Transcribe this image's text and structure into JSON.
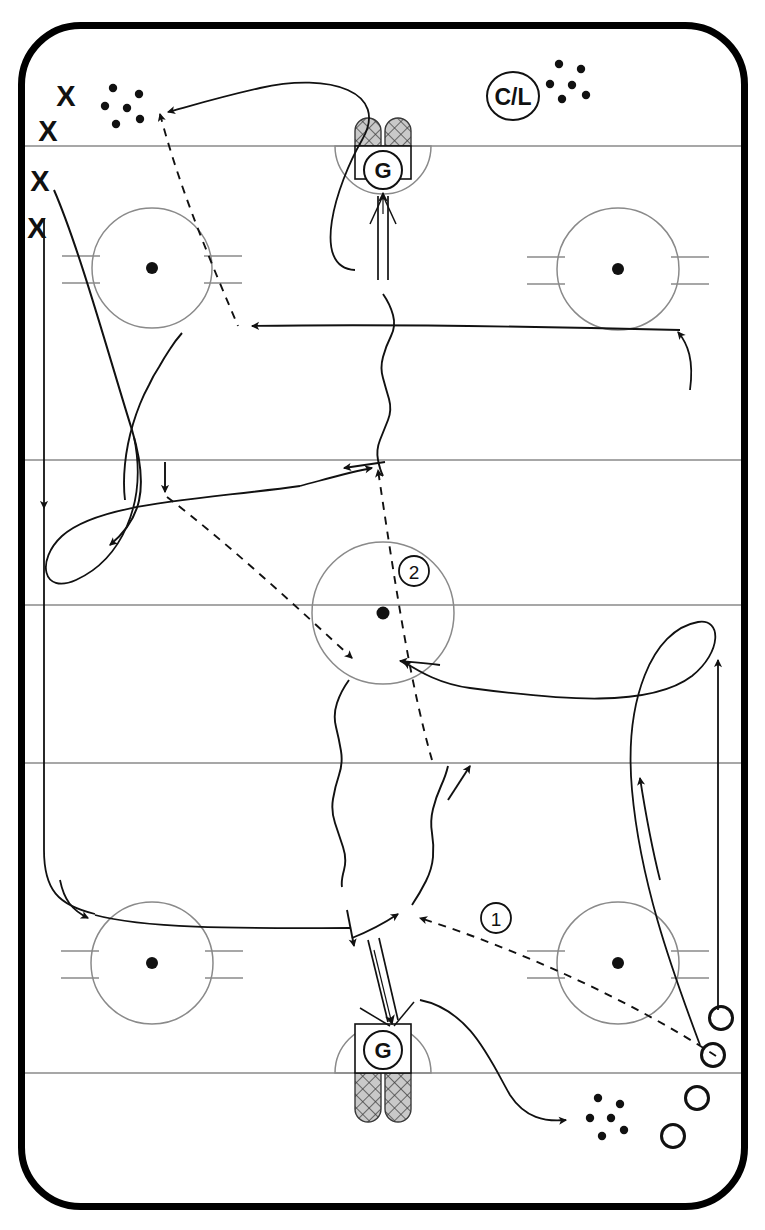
{
  "diagram": {
    "type": "ice-hockey-drill",
    "sport": "ice hockey"
  },
  "rink": {
    "board_color": "#000000",
    "line_color": "#8a8a8a",
    "ice_color": "#ffffff",
    "board_thickness": 7,
    "corner_radius": 62,
    "x": 18,
    "y": 22,
    "width": 730,
    "height": 1188,
    "lines": [
      {
        "name": "top-goal-line",
        "y": 146
      },
      {
        "name": "top-blue-line",
        "y": 460
      },
      {
        "name": "center-red-line",
        "y": 605
      },
      {
        "name": "bottom-blue-line",
        "y": 763
      },
      {
        "name": "bottom-goal-line",
        "y": 1073
      }
    ]
  },
  "faceoff_circles": [
    {
      "name": "top-left-faceoff-circle",
      "cx": 152,
      "cy": 268,
      "r": 60
    },
    {
      "name": "top-right-faceoff-circle",
      "cx": 618,
      "cy": 269,
      "r": 61
    },
    {
      "name": "center-faceoff-circle",
      "cx": 383,
      "cy": 613,
      "r": 71,
      "label": "2"
    },
    {
      "name": "bottom-left-faceoff-circle",
      "cx": 152,
      "cy": 963,
      "r": 61
    },
    {
      "name": "bottom-right-faceoff-circle",
      "cx": 618,
      "cy": 963,
      "r": 61
    }
  ],
  "goals": [
    {
      "name": "top-goal",
      "label": "G",
      "cx": 383,
      "cy": 170,
      "net_side": "above-goal-line"
    },
    {
      "name": "bottom-goal",
      "label": "G",
      "cx": 383,
      "cy": 1050,
      "net_side": "below-goal-line"
    }
  ],
  "labels": {
    "coach_line": "C/L",
    "sequence_one": "1",
    "sequence_two": "2",
    "goalie": "G",
    "attackers_symbol": "X",
    "defenders_symbol": "O"
  },
  "players": {
    "x_players": [
      {
        "name": "x-player-1",
        "x": 66,
        "y": 96
      },
      {
        "name": "x-player-2",
        "x": 48,
        "y": 131
      },
      {
        "name": "x-player-3",
        "x": 39,
        "y": 181
      },
      {
        "name": "x-player-4",
        "x": 36,
        "y": 228
      }
    ],
    "o_players": [
      {
        "name": "o-player-1",
        "x": 721,
        "y": 1018
      },
      {
        "name": "o-player-2",
        "x": 713,
        "y": 1055
      },
      {
        "name": "o-player-3",
        "x": 697,
        "y": 1098
      },
      {
        "name": "o-player-4",
        "x": 673,
        "y": 1136
      }
    ]
  },
  "puck_piles": [
    {
      "name": "puck-pile-top-left",
      "cx": 124,
      "cy": 104,
      "count": 6
    },
    {
      "name": "puck-pile-top-right",
      "cx": 570,
      "cy": 81,
      "count": 6
    },
    {
      "name": "puck-pile-bottom-right",
      "cx": 607,
      "cy": 1116,
      "count": 6
    }
  ],
  "path_legend": {
    "skating": "solid line with arrowhead",
    "pass": "dashed line with arrowhead",
    "shot": "wavy line with arrowhead",
    "puck_carry": "double line with arrowhead"
  },
  "paths": {
    "skating_count": 7,
    "pass_count": 4,
    "shot_count": 4,
    "carry_count": 2
  }
}
